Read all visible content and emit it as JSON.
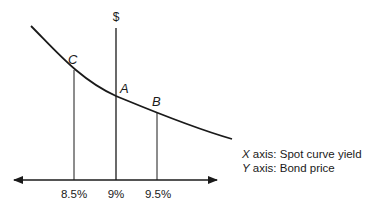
{
  "diagram": {
    "y_axis_symbol": "$",
    "points": [
      {
        "label": "C",
        "yield": "8.5%"
      },
      {
        "label": "A",
        "yield": "9%"
      },
      {
        "label": "B",
        "yield": "9.5%"
      }
    ],
    "x_ticks": [
      "8.5%",
      "9%",
      "9.5%"
    ],
    "legend": {
      "x_prefix": "X",
      "x_text": " axis: Spot curve yield",
      "y_prefix": "Y",
      "y_text": " axis: Bond price"
    },
    "colors": {
      "line": "#1a1a1a",
      "background": "#ffffff"
    }
  }
}
